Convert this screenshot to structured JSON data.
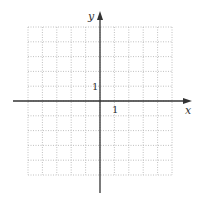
{
  "diagram": {
    "type": "coordinate-grid",
    "grid": {
      "min": -5,
      "max": 5,
      "step": 1,
      "style": "dotted",
      "color": "#b0b0b0"
    },
    "axes": {
      "x_label": "x",
      "y_label": "y",
      "color": "#333333"
    },
    "tick_labels": {
      "x_unit": "1",
      "y_unit": "1"
    }
  }
}
